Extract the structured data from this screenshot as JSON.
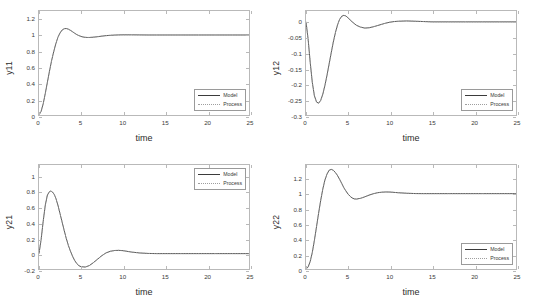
{
  "figure": {
    "background": "#ffffff",
    "axis_color": "#b9b9b9",
    "model_color": "#3b3b3b",
    "process_color": "#9e9e9e"
  },
  "legend": {
    "model_label": "Model",
    "process_label": "Process"
  },
  "chart_data": [
    {
      "type": "line",
      "id": "y11",
      "title": "",
      "xlabel": "time",
      "ylabel": "y11",
      "xlim": [
        0,
        25
      ],
      "ylim": [
        0,
        1.3
      ],
      "xticks": [
        "0",
        "5",
        "10",
        "15",
        "20",
        "25"
      ],
      "xtick_values": [
        0,
        5,
        10,
        15,
        20,
        25
      ],
      "yticks": [
        "0",
        "0.2",
        "0.4",
        "0.6",
        "0.8",
        "1",
        "1.2"
      ],
      "ytick_values": [
        0,
        0.2,
        0.4,
        0.6,
        0.8,
        1,
        1.2
      ],
      "grid": false,
      "legend_position": "lower-right",
      "series": [
        {
          "name": "Model",
          "style": "solid",
          "x": [
            0,
            0.25,
            0.5,
            0.75,
            1,
            1.25,
            1.5,
            1.75,
            2,
            2.25,
            2.5,
            2.75,
            3,
            3.25,
            3.5,
            3.75,
            4,
            4.25,
            4.5,
            4.75,
            5,
            5.25,
            5.5,
            5.75,
            6,
            6.5,
            7,
            7.5,
            8,
            8.5,
            9,
            9.5,
            10,
            11,
            12,
            13,
            14,
            15,
            17,
            19,
            21,
            23,
            25
          ],
          "y": [
            0,
            0.045,
            0.14,
            0.27,
            0.41,
            0.55,
            0.68,
            0.79,
            0.89,
            0.97,
            1.025,
            1.062,
            1.079,
            1.081,
            1.073,
            1.058,
            1.04,
            1.022,
            1.005,
            0.992,
            0.982,
            0.975,
            0.971,
            0.969,
            0.969,
            0.973,
            0.979,
            0.986,
            0.992,
            0.996,
            0.999,
            1.001,
            1.002,
            1.002,
            1.001,
            1.0,
            1.0,
            1.0,
            1.0,
            1.0,
            1.0,
            1.0,
            1.0
          ]
        },
        {
          "name": "Process",
          "style": "dotted",
          "x": [
            0,
            0.25,
            0.5,
            0.75,
            1,
            1.25,
            1.5,
            1.75,
            2,
            2.25,
            2.5,
            2.75,
            3,
            3.25,
            3.5,
            3.75,
            4,
            4.25,
            4.5,
            4.75,
            5,
            5.25,
            5.5,
            5.75,
            6,
            6.5,
            7,
            7.5,
            8,
            8.5,
            9,
            9.5,
            10,
            11,
            12,
            13,
            14,
            15,
            17,
            19,
            21,
            23,
            25
          ],
          "y": [
            0,
            0.045,
            0.14,
            0.27,
            0.41,
            0.55,
            0.68,
            0.79,
            0.89,
            0.97,
            1.025,
            1.062,
            1.079,
            1.081,
            1.073,
            1.058,
            1.04,
            1.022,
            1.005,
            0.992,
            0.982,
            0.975,
            0.971,
            0.969,
            0.969,
            0.973,
            0.979,
            0.986,
            0.992,
            0.996,
            0.999,
            1.001,
            1.002,
            1.002,
            1.001,
            1.0,
            1.0,
            1.0,
            1.0,
            1.0,
            1.0,
            1.0,
            1.0
          ]
        }
      ]
    },
    {
      "type": "line",
      "id": "y12",
      "title": "",
      "xlabel": "time",
      "ylabel": "y12",
      "xlim": [
        0,
        25
      ],
      "ylim": [
        -0.3,
        0.035
      ],
      "xticks": [
        "0",
        "5",
        "10",
        "15",
        "20",
        "25"
      ],
      "xtick_values": [
        0,
        5,
        10,
        15,
        20,
        25
      ],
      "yticks": [
        "0",
        "-0.05",
        "-0.1",
        "-0.15",
        "-0.2",
        "-0.25",
        "-0.3"
      ],
      "ytick_values": [
        0,
        -0.05,
        -0.1,
        -0.15,
        -0.2,
        -0.25,
        -0.3
      ],
      "grid": false,
      "legend_position": "lower-right",
      "series": [
        {
          "name": "Model",
          "style": "solid",
          "x": [
            0,
            0.25,
            0.5,
            0.75,
            1,
            1.25,
            1.5,
            1.75,
            2,
            2.25,
            2.5,
            2.75,
            3,
            3.25,
            3.5,
            3.75,
            4,
            4.25,
            4.5,
            4.75,
            5,
            5.5,
            6,
            6.5,
            7,
            7.5,
            8,
            8.5,
            9,
            9.5,
            10,
            10.5,
            11,
            12,
            13,
            14,
            15,
            17,
            19,
            21,
            23,
            25
          ],
          "y": [
            0,
            -0.055,
            -0.13,
            -0.195,
            -0.238,
            -0.258,
            -0.262,
            -0.253,
            -0.233,
            -0.205,
            -0.172,
            -0.136,
            -0.1,
            -0.065,
            -0.035,
            -0.01,
            0.008,
            0.018,
            0.021,
            0.019,
            0.013,
            0.0,
            -0.011,
            -0.017,
            -0.02,
            -0.019,
            -0.016,
            -0.012,
            -0.008,
            -0.004,
            -0.001,
            0.001,
            0.002,
            0.003,
            0.002,
            0.001,
            0.0,
            0.0,
            0.0,
            0.0,
            0.0,
            0.0
          ]
        },
        {
          "name": "Process",
          "style": "dotted",
          "x": [
            0,
            0.25,
            0.5,
            0.75,
            1,
            1.25,
            1.5,
            1.75,
            2,
            2.25,
            2.5,
            2.75,
            3,
            3.25,
            3.5,
            3.75,
            4,
            4.25,
            4.5,
            4.75,
            5,
            5.5,
            6,
            6.5,
            7,
            7.5,
            8,
            8.5,
            9,
            9.5,
            10,
            10.5,
            11,
            12,
            13,
            14,
            15,
            17,
            19,
            21,
            23,
            25
          ],
          "y": [
            0,
            -0.055,
            -0.13,
            -0.195,
            -0.238,
            -0.258,
            -0.262,
            -0.253,
            -0.233,
            -0.205,
            -0.172,
            -0.136,
            -0.1,
            -0.065,
            -0.035,
            -0.01,
            0.008,
            0.018,
            0.021,
            0.019,
            0.013,
            0.0,
            -0.011,
            -0.017,
            -0.02,
            -0.019,
            -0.016,
            -0.012,
            -0.008,
            -0.004,
            -0.001,
            0.001,
            0.002,
            0.003,
            0.002,
            0.001,
            0.0,
            0.0,
            0.0,
            0.0,
            0.0,
            0.0
          ]
        }
      ]
    },
    {
      "type": "line",
      "id": "y21",
      "title": "",
      "xlabel": "time",
      "ylabel": "y21",
      "xlim": [
        0,
        25
      ],
      "ylim": [
        -0.2,
        1.15
      ],
      "xticks": [
        "0",
        "5",
        "10",
        "15",
        "20",
        "25"
      ],
      "xtick_values": [
        0,
        5,
        10,
        15,
        20,
        25
      ],
      "yticks": [
        "1",
        "0.8",
        "0.6",
        "0.4",
        "0.2",
        "0",
        "-0.2"
      ],
      "ytick_values": [
        1,
        0.8,
        0.6,
        0.4,
        0.2,
        0,
        -0.2
      ],
      "grid": false,
      "legend_position": "upper-right",
      "series": [
        {
          "name": "Model",
          "style": "solid",
          "x": [
            0,
            0.25,
            0.5,
            0.75,
            1,
            1.25,
            1.4,
            1.6,
            1.8,
            2,
            2.25,
            2.5,
            2.75,
            3,
            3.25,
            3.5,
            3.75,
            4,
            4.25,
            4.5,
            4.75,
            5,
            5.5,
            6,
            6.5,
            7,
            7.5,
            8,
            8.5,
            9,
            9.5,
            10,
            11,
            12,
            13,
            14,
            15,
            17,
            19,
            21,
            23,
            25
          ],
          "y": [
            0,
            0.18,
            0.42,
            0.63,
            0.76,
            0.805,
            0.812,
            0.8,
            0.77,
            0.72,
            0.63,
            0.52,
            0.41,
            0.3,
            0.195,
            0.105,
            0.03,
            -0.035,
            -0.09,
            -0.13,
            -0.157,
            -0.17,
            -0.175,
            -0.155,
            -0.115,
            -0.07,
            -0.025,
            0.01,
            0.03,
            0.04,
            0.042,
            0.038,
            0.02,
            0.008,
            0.002,
            0.0,
            0.0,
            0.0,
            0.0,
            0.0,
            0.0,
            0.0
          ]
        },
        {
          "name": "Process",
          "style": "dotted",
          "x": [
            0,
            0.25,
            0.5,
            0.75,
            1,
            1.25,
            1.4,
            1.6,
            1.8,
            2,
            2.25,
            2.5,
            2.75,
            3,
            3.25,
            3.5,
            3.75,
            4,
            4.25,
            4.5,
            4.75,
            5,
            5.5,
            6,
            6.5,
            7,
            7.5,
            8,
            8.5,
            9,
            9.5,
            10,
            11,
            12,
            13,
            14,
            15,
            17,
            19,
            21,
            23,
            25
          ],
          "y": [
            0,
            0.18,
            0.42,
            0.63,
            0.76,
            0.805,
            0.812,
            0.8,
            0.77,
            0.72,
            0.63,
            0.52,
            0.41,
            0.3,
            0.195,
            0.105,
            0.03,
            -0.035,
            -0.09,
            -0.13,
            -0.157,
            -0.17,
            -0.175,
            -0.155,
            -0.115,
            -0.07,
            -0.025,
            0.01,
            0.03,
            0.04,
            0.042,
            0.038,
            0.02,
            0.008,
            0.002,
            0.0,
            0.0,
            0.0,
            0.0,
            0.0,
            0.0,
            0.0
          ]
        }
      ]
    },
    {
      "type": "line",
      "id": "y22",
      "title": "",
      "xlabel": "time",
      "ylabel": "y22",
      "xlim": [
        0,
        25
      ],
      "ylim": [
        0,
        1.38
      ],
      "xticks": [
        "0",
        "5",
        "10",
        "15",
        "20",
        "25"
      ],
      "xtick_values": [
        0,
        5,
        10,
        15,
        20,
        25
      ],
      "yticks": [
        "0",
        "0.2",
        "0.4",
        "0.6",
        "0.8",
        "1",
        "1.2"
      ],
      "ytick_values": [
        0,
        0.2,
        0.4,
        0.6,
        0.8,
        1,
        1.2
      ],
      "grid": false,
      "legend_position": "lower-right",
      "series": [
        {
          "name": "Model",
          "style": "solid",
          "x": [
            0,
            0.25,
            0.5,
            0.75,
            1,
            1.25,
            1.5,
            1.75,
            2,
            2.25,
            2.5,
            2.75,
            3,
            3.25,
            3.5,
            3.75,
            4,
            4.25,
            4.5,
            4.75,
            5,
            5.25,
            5.5,
            5.75,
            6,
            6.5,
            7,
            7.5,
            8,
            8.5,
            9,
            9.5,
            10,
            11,
            12,
            13,
            14,
            15,
            17,
            19,
            21,
            23,
            25
          ],
          "y": [
            0,
            0.025,
            0.1,
            0.22,
            0.38,
            0.56,
            0.74,
            0.91,
            1.06,
            1.18,
            1.26,
            1.31,
            1.322,
            1.31,
            1.28,
            1.24,
            1.19,
            1.135,
            1.08,
            1.035,
            0.995,
            0.965,
            0.942,
            0.93,
            0.928,
            0.938,
            0.958,
            0.98,
            0.998,
            1.012,
            1.019,
            1.022,
            1.021,
            1.012,
            1.005,
            1.001,
            1.0,
            1.0,
            1.0,
            1.0,
            1.0,
            1.0,
            1.0
          ]
        },
        {
          "name": "Process",
          "style": "dotted",
          "x": [
            0,
            0.25,
            0.5,
            0.75,
            1,
            1.25,
            1.5,
            1.75,
            2,
            2.25,
            2.5,
            2.75,
            3,
            3.25,
            3.5,
            3.75,
            4,
            4.25,
            4.5,
            4.75,
            5,
            5.25,
            5.5,
            5.75,
            6,
            6.5,
            7,
            7.5,
            8,
            8.5,
            9,
            9.5,
            10,
            11,
            12,
            13,
            14,
            15,
            17,
            19,
            21,
            23,
            25
          ],
          "y": [
            0,
            0.025,
            0.1,
            0.22,
            0.38,
            0.56,
            0.74,
            0.91,
            1.06,
            1.18,
            1.26,
            1.31,
            1.322,
            1.31,
            1.28,
            1.24,
            1.19,
            1.135,
            1.08,
            1.035,
            0.995,
            0.965,
            0.942,
            0.93,
            0.928,
            0.938,
            0.958,
            0.98,
            0.998,
            1.012,
            1.019,
            1.022,
            1.021,
            1.012,
            1.005,
            1.001,
            1.0,
            1.0,
            1.0,
            1.0,
            1.0,
            1.0,
            1.0
          ]
        }
      ]
    }
  ]
}
